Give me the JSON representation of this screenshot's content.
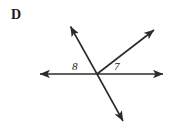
{
  "figure": {
    "part_letter": "D",
    "stroke_color": "#2b2b2b",
    "background_color": "#ffffff",
    "vertex": {
      "x": 97,
      "y": 74
    },
    "labels": [
      {
        "name": "angle-8",
        "text": "8",
        "x": 72,
        "y": 61
      },
      {
        "name": "angle-7",
        "text": "7",
        "x": 114,
        "y": 61
      }
    ],
    "rays": [
      {
        "name": "ray-left",
        "to_x": 36,
        "to_y": 74,
        "arrowhead": true
      },
      {
        "name": "ray-right",
        "to_x": 168,
        "to_y": 74,
        "arrowhead": true
      },
      {
        "name": "ray-upper-left",
        "to_x": 68,
        "to_y": 22,
        "arrowhead": true
      },
      {
        "name": "ray-upper-right",
        "to_x": 158,
        "to_y": 26,
        "arrowhead": true
      },
      {
        "name": "ray-lower-right",
        "to_x": 126,
        "to_y": 126,
        "arrowhead": true
      }
    ]
  }
}
